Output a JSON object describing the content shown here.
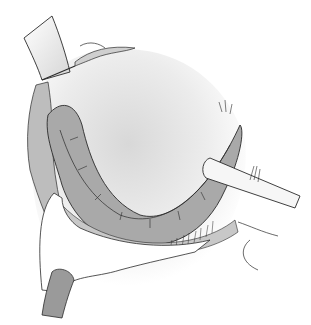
{
  "illustration": {
    "subject": "surgical line drawing",
    "colors": {
      "background": "#ffffff",
      "line": "#2a2a2a",
      "tissue_fill": "#a9a9a9",
      "tissue_light": "#cfcfcf",
      "cavity_light": "#e6e6e6",
      "instrument_fill": "#f4f4f4",
      "retractor_fill": "#9a9a9a"
    }
  }
}
